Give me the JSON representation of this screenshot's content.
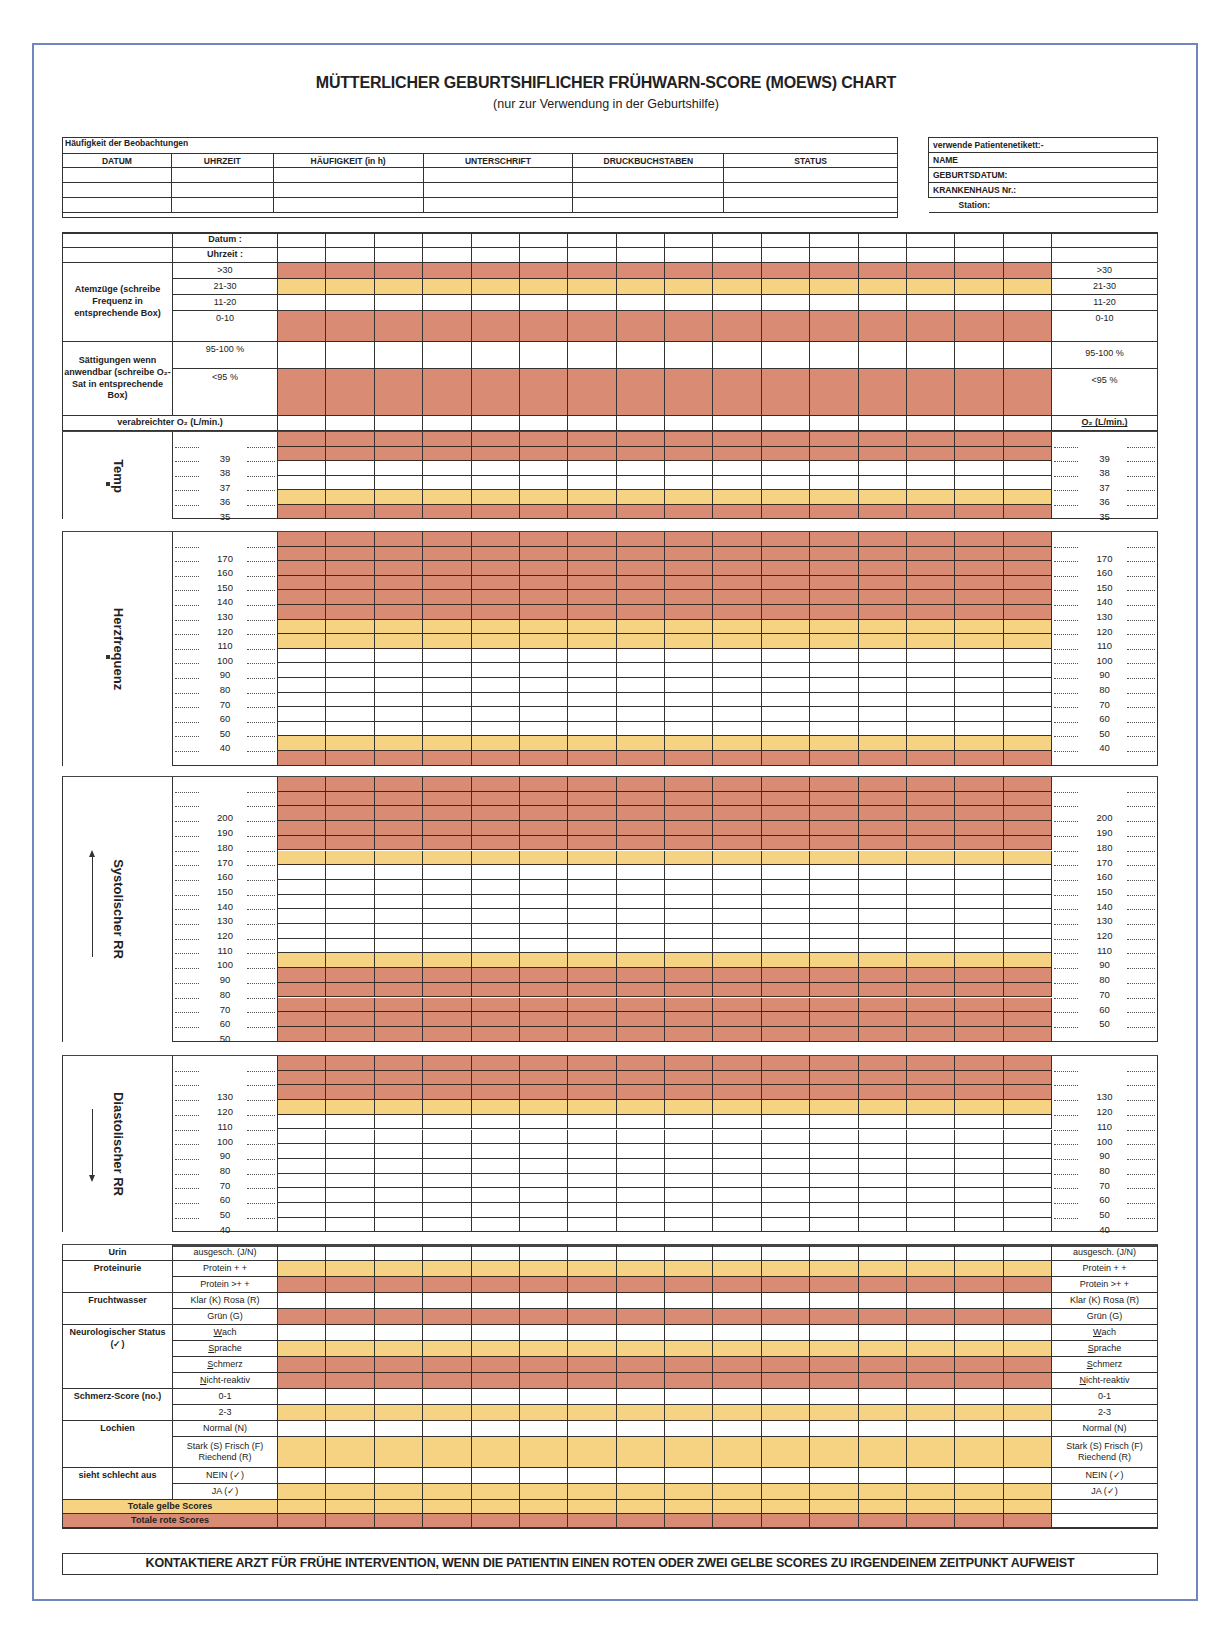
{
  "title": "MÜTTERLICHER GEBURTSHIFLICHER FRÜHWARN-SCORE (MOEWS) CHART",
  "subtitle": "(nur zur Verwendung in der Geburtshilfe)",
  "observation_table": {
    "caption": "Häufigkeit der Beobachtungen",
    "headers": [
      "DATUM",
      "UHRZEIT",
      "HÄUFIGKEIT (in h)",
      "UNTERSCHRIFT",
      "DRUCKBUCHSTABEN",
      "STATUS"
    ],
    "rows": [
      [
        "",
        "",
        "",
        "",
        "",
        ""
      ],
      [
        "",
        "",
        "",
        "",
        "",
        ""
      ],
      [
        "",
        "",
        "",
        "",
        "",
        ""
      ]
    ]
  },
  "patient_label": {
    "caption": "verwende Patientenetikett:-",
    "fields": [
      "NAME",
      "GEBURTSDATUM:",
      "KRANKENHAUS Nr.:",
      "Station:"
    ]
  },
  "colors": {
    "red": "#d98b74",
    "yellow": "#f6d383",
    "frame": "#6f87bd"
  },
  "grid": {
    "data_columns": 16,
    "header": {
      "datum": "Datum :",
      "uhrzeit": "Uhrzeit :"
    },
    "atemzuege": {
      "label": "Atemzüge (schreibe Frequenz in entsprechende Box)",
      "rows": [
        {
          "label": ">30",
          "zone": "red"
        },
        {
          "label": "21-30",
          "zone": "yellow"
        },
        {
          "label": "11-20",
          "zone": "white"
        },
        {
          "label": "0-10",
          "zone": "red"
        }
      ]
    },
    "saettigung": {
      "label": "Sättigungen wenn anwendbar (schreibe O₂-Sat in entsprechende Box)",
      "rows": [
        {
          "label": "95-100 %",
          "zone": "white"
        },
        {
          "label": "<95 %",
          "zone": "red"
        }
      ]
    },
    "o2": {
      "label": "verabreichter O₂ (L/min.)",
      "right_label": "O₂ (L/min.)"
    },
    "temp": {
      "label": "Temp",
      "ticks": [
        "39",
        "38",
        "37",
        "36",
        "35"
      ],
      "zones": [
        "red",
        "red",
        "white",
        "white",
        "yellow",
        "red"
      ]
    },
    "herzfrequenz": {
      "label": "Herzfrequenz",
      "ticks": [
        "170",
        "160",
        "150",
        "140",
        "130",
        "120",
        "110",
        "100",
        "90",
        "80",
        "70",
        "60",
        "50",
        "40"
      ],
      "zones": [
        "red",
        "red",
        "red",
        "red",
        "red",
        "red",
        "yellow",
        "yellow",
        "white",
        "white",
        "white",
        "white",
        "white",
        "white",
        "yellow",
        "red"
      ]
    },
    "systolisch": {
      "label": "Systolischer RR",
      "ticks_left": [
        "200",
        "190",
        "180",
        "170",
        "160",
        "150",
        "140",
        "130",
        "120",
        "110",
        "100",
        "90",
        "80",
        "70",
        "60",
        "50"
      ],
      "ticks_right": [
        "200",
        "190",
        "180",
        "170",
        "160",
        "150",
        "140",
        "130",
        "120",
        "110",
        "90",
        "80",
        "70",
        "60",
        "50"
      ],
      "zones": [
        "red",
        "red",
        "red",
        "red",
        "red",
        "yellow",
        "white",
        "white",
        "white",
        "white",
        "white",
        "white",
        "yellow",
        "red",
        "red",
        "red",
        "red",
        "red"
      ]
    },
    "diastolisch": {
      "label": "Diastolischer RR",
      "ticks": [
        "130",
        "120",
        "110",
        "100",
        "90",
        "80",
        "70",
        "60",
        "50",
        "40"
      ],
      "zones": [
        "red",
        "red",
        "red",
        "yellow",
        "white",
        "white",
        "white",
        "white",
        "white",
        "white",
        "white",
        "white"
      ]
    },
    "urin": {
      "label": "Urin",
      "rows": [
        {
          "label": "ausgesch. (J/N)",
          "zone": "white"
        }
      ]
    },
    "proteinurie": {
      "label": "Proteinurie",
      "rows": [
        {
          "label": "Protein + +",
          "zone": "yellow"
        },
        {
          "label": "Protein >+ +",
          "zone": "red"
        }
      ]
    },
    "fruchtwasser": {
      "label": "Fruchtwasser",
      "rows": [
        {
          "label": "Klar (K) Rosa (R)",
          "zone": "white"
        },
        {
          "label": "Grün (G)",
          "zone": "red"
        }
      ]
    },
    "neuro": {
      "label": "Neurologischer Status (✓)",
      "rows": [
        {
          "label": "Wach",
          "zone": "white"
        },
        {
          "label": "Sprache",
          "zone": "yellow"
        },
        {
          "label": "Schmerz",
          "zone": "red"
        },
        {
          "label": "Nicht-reaktiv",
          "zone": "red"
        }
      ]
    },
    "schmerz": {
      "label": "Schmerz-Score (no.)",
      "rows": [
        {
          "label": "0-1",
          "zone": "white"
        },
        {
          "label": "2-3",
          "zone": "yellow"
        }
      ]
    },
    "lochien": {
      "label": "Lochien",
      "rows": [
        {
          "label": "Normal (N)",
          "zone": "white"
        },
        {
          "label": "Stark (S) Frisch (F) Riechend (R)",
          "right_label": "Stark (S) Frisch (F) Riechend (R)",
          "zone": "yellow"
        }
      ]
    },
    "schlecht": {
      "label": "sieht schlecht aus",
      "rows": [
        {
          "label": "NEIN (✓)",
          "zone": "white"
        },
        {
          "label": "JA (✓)",
          "zone": "yellow"
        }
      ]
    },
    "totals": {
      "yellow_label": "Totale gelbe Scores",
      "red_label": "Totale rote Scores"
    }
  },
  "footer": "KONTAKTIERE ARZT FÜR FRÜHE INTERVENTION, WENN DIE PATIENTIN EINEN ROTEN ODER ZWEI GELBE SCORES ZU IRGENDEINEM ZEITPUNKT AUFWEIST"
}
